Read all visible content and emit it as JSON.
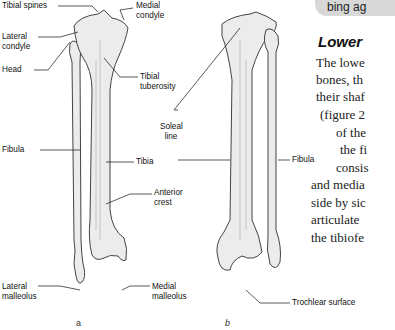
{
  "figure": {
    "panel_a": {
      "caption": "a",
      "labels": {
        "tibial_spines": "Tibial spines",
        "medial_condyle": "Medial condyle",
        "lateral_condyle": "Lateral condyle",
        "head": "Head",
        "tibial_tuberosity": "Tibial tuberosity",
        "fibula": "Fibula",
        "tibia": "Tibia",
        "anterior_crest": "Anterior crest",
        "lateral_malleolus": "Lateral malleolus",
        "medial_malleolus": "Medial malleolus"
      }
    },
    "panel_b": {
      "caption": "b",
      "labels": {
        "soleal_line": "Soleal line",
        "fibula": "Fibula",
        "trochlear_surface": "Trochlear surface"
      }
    }
  },
  "callout": {
    "text": "bing ag"
  },
  "section": {
    "heading": "Lower",
    "lines": [
      "The lowe",
      "bones, th",
      "their shaf",
      "(figure 2",
      "of the",
      "the fi",
      "consis",
      "and media",
      "side by sic",
      "articulate",
      "the tibiofe"
    ]
  },
  "colors": {
    "bone_fill": "#ececec",
    "bone_stroke": "#444444",
    "callout_bg": "#d8d8d8"
  }
}
